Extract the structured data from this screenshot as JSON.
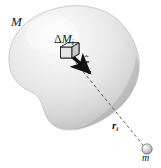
{
  "figure": {
    "background_color": "#ffffff",
    "width": 161,
    "height": 168,
    "labels": {
      "body_mass": "M",
      "mass_element_delta": "Δ",
      "mass_element_main": "M",
      "mass_element_sub": "i",
      "unit_vector_base": "r",
      "unit_vector_hat": "ˆ",
      "distance_main": "r",
      "distance_sub": "i",
      "point_mass": "m"
    },
    "colors": {
      "ink": "#1a1a1a",
      "blob_light": "#fbfbfb",
      "blob_mid": "#e2e2e2",
      "blob_edge": "#b4b4b4",
      "blob_outline": "#9a9a9a",
      "arrow": "#111111",
      "dashed_line": "#555555",
      "cube_face": "#d8d8d8",
      "cube_line": "#1a1a1a",
      "sphere_fill": "#cfcfcf"
    },
    "elements": {
      "blob_name": "extended-body-blob",
      "cube_name": "mass-element-cube",
      "arrow_name": "unit-vector-arrow",
      "dashed_name": "distance-dashed-line",
      "sphere_name": "point-mass-sphere"
    }
  }
}
